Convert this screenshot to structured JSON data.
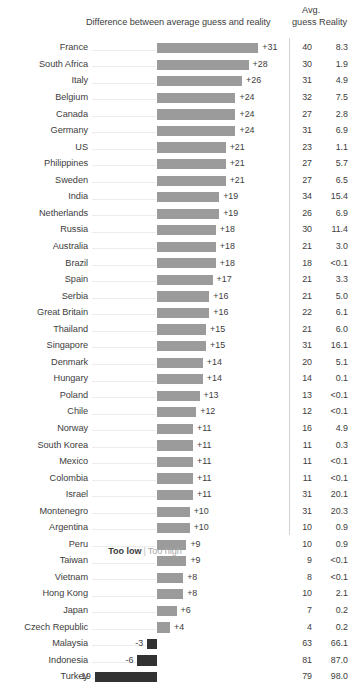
{
  "header": {
    "bar_title": "Difference between average guess and reality",
    "avg_line1": "Avg.",
    "avg_line2": "guess",
    "reality": "Reality"
  },
  "legend": {
    "too_low": "Too low",
    "separator": "|",
    "too_high": "Too high"
  },
  "chart_data": {
    "type": "bar",
    "title": "Difference between average guess and reality",
    "xlabel": "",
    "ylabel": "",
    "orientation": "horizontal",
    "grid": false,
    "legend_position": "bottom",
    "columns": [
      "Country",
      "Difference",
      "Avg. guess",
      "Reality"
    ],
    "xlim": [
      -19,
      31
    ],
    "categories": [
      "France",
      "South Africa",
      "Italy",
      "Belgium",
      "Canada",
      "Germany",
      "US",
      "Philippines",
      "Sweden",
      "India",
      "Netherlands",
      "Russia",
      "Australia",
      "Brazil",
      "Spain",
      "Serbia",
      "Great Britain",
      "Thailand",
      "Singapore",
      "Denmark",
      "Hungary",
      "Poland",
      "Chile",
      "Norway",
      "South Korea",
      "Mexico",
      "Colombia",
      "Israel",
      "Montenegro",
      "Argentina",
      "Peru",
      "Taiwan",
      "Vietnam",
      "Hong Kong",
      "Japan",
      "Czech Republic",
      "Malaysia",
      "Indonesia",
      "Turkey"
    ],
    "values": [
      31,
      28,
      26,
      24,
      24,
      24,
      21,
      21,
      21,
      19,
      19,
      18,
      18,
      18,
      17,
      16,
      16,
      15,
      15,
      14,
      14,
      13,
      12,
      11,
      11,
      11,
      11,
      11,
      10,
      10,
      9,
      9,
      8,
      8,
      6,
      4,
      -3,
      -6,
      -19
    ],
    "value_labels": [
      "+31",
      "+28",
      "+26",
      "+24",
      "+24",
      "+24",
      "+21",
      "+21",
      "+21",
      "+19",
      "+19",
      "+18",
      "+18",
      "+18",
      "+17",
      "+16",
      "+16",
      "+15",
      "+15",
      "+14",
      "+14",
      "+13",
      "+12",
      "+11",
      "+11",
      "+11",
      "+11",
      "+11",
      "+10",
      "+10",
      "+9",
      "+9",
      "+8",
      "+8",
      "+6",
      "+4",
      "-3",
      "-6",
      "-19"
    ],
    "avg_guess": [
      "40",
      "30",
      "31",
      "32",
      "27",
      "31",
      "23",
      "27",
      "27",
      "34",
      "26",
      "30",
      "21",
      "18",
      "21",
      "21",
      "22",
      "21",
      "31",
      "20",
      "14",
      "13",
      "12",
      "16",
      "11",
      "11",
      "11",
      "31",
      "31",
      "10",
      "10",
      "9",
      "8",
      "10",
      "7",
      "4",
      "63",
      "81",
      "79"
    ],
    "reality": [
      "8.3",
      "1.9",
      "4.9",
      "7.5",
      "2.8",
      "6.9",
      "1.1",
      "5.7",
      "6.5",
      "15.4",
      "6.9",
      "11.4",
      "3.0",
      "<0.1",
      "3.3",
      "5.0",
      "6.1",
      "6.0",
      "16.1",
      "5.1",
      "0.1",
      "<0.1",
      "<0.1",
      "4.9",
      "0.3",
      "<0.1",
      "<0.1",
      "20.1",
      "20.3",
      "0.9",
      "0.9",
      "<0.1",
      "<0.1",
      "2.1",
      "0.2",
      "0.2",
      "66.1",
      "87.0",
      "98.0"
    ],
    "colors": {
      "positive_bar": "#9b9b9b",
      "negative_bar": "#323232",
      "text": "#3d3d3d",
      "leader_line": "#ececec",
      "divider": "#d2d2d2"
    }
  }
}
